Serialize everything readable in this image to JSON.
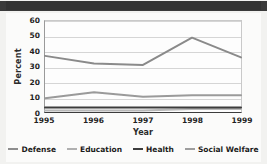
{
  "header": {
    "bar_color": "#3a3a3a"
  },
  "chart_data": {
    "type": "line",
    "title": "",
    "xlabel": "Year",
    "ylabel": "Percent",
    "categories": [
      "1995",
      "1996",
      "1997",
      "1998",
      "1999"
    ],
    "x": [
      1995,
      1996,
      1997,
      1998,
      1999
    ],
    "ylim": [
      0,
      60
    ],
    "yticks": [
      0,
      10,
      20,
      30,
      40,
      50,
      60
    ],
    "grid": true,
    "legend_position": "bottom",
    "series": [
      {
        "name": "Defense",
        "values": [
          1,
          1,
          1,
          2,
          2
        ],
        "color": "#b8b8b8"
      },
      {
        "name": "Education",
        "values": [
          9,
          13,
          10,
          11,
          11
        ],
        "color": "#9a9a9a"
      },
      {
        "name": "Health",
        "values": [
          3,
          3,
          3,
          3,
          3
        ],
        "color": "#3d3d3d"
      },
      {
        "name": "Social Welfare",
        "values": [
          37,
          32,
          31,
          49,
          36
        ],
        "color": "#8a8a8a"
      }
    ]
  },
  "legend": {
    "items": [
      {
        "label": "Defense",
        "color": "#8e8e8e"
      },
      {
        "label": "Education",
        "color": "#b0b0b0"
      },
      {
        "label": "Health",
        "color": "#3d3d3d"
      },
      {
        "label": "Social Welfare",
        "color": "#9e9e9e"
      }
    ]
  }
}
